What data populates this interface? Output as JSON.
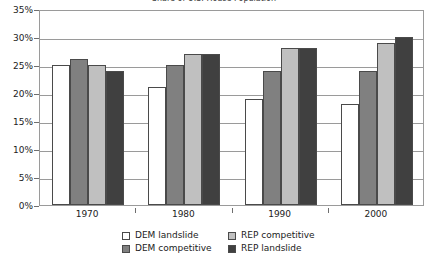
{
  "chart_data": {
    "type": "bar",
    "title": "Share of U.S. House Population",
    "xlabel": "",
    "ylabel": "",
    "categories": [
      "1970",
      "1980",
      "1990",
      "2000"
    ],
    "ylim": [
      0,
      35
    ],
    "ytick_labels": [
      "0%",
      "5%",
      "10%",
      "15%",
      "20%",
      "25%",
      "30%",
      "35%"
    ],
    "ytick_values": [
      0,
      5,
      10,
      15,
      20,
      25,
      30,
      35
    ],
    "grid": true,
    "legend_position": "bottom",
    "series": [
      {
        "name": "DEM landslide",
        "color": "#ffffff",
        "values": [
          25,
          21,
          19,
          18
        ]
      },
      {
        "name": "DEM competitive",
        "color": "#808080",
        "values": [
          26,
          25,
          24,
          24
        ]
      },
      {
        "name": "REP competitive",
        "color": "#c0c0c0",
        "values": [
          25,
          27,
          28,
          29
        ]
      },
      {
        "name": "REP landslide",
        "color": "#404040",
        "values": [
          24,
          27,
          28,
          30
        ]
      }
    ]
  },
  "legend": {
    "items": [
      {
        "label": "DEM landslide",
        "swatch": "#ffffff"
      },
      {
        "label": "DEM competitive",
        "swatch": "#808080"
      },
      {
        "label": "REP competitive",
        "swatch": "#c0c0c0"
      },
      {
        "label": "REP landslide",
        "swatch": "#404040"
      }
    ]
  },
  "colors": {
    "axis": "#9a9a9a",
    "tick": "#6e6e6e",
    "bar_border": "#4a4a4a",
    "text": "#222222",
    "background": "#ffffff"
  }
}
